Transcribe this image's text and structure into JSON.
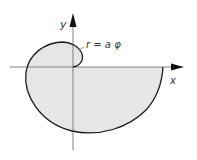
{
  "diagram": {
    "labels": {
      "y_axis": "y",
      "x_axis": "x",
      "equation": "r = a φ"
    },
    "colors": {
      "curve": "#1a1a1a",
      "fill": "#e6e6e6",
      "axes": "#808080",
      "arrow": "#111111",
      "text": "#333333"
    }
  }
}
